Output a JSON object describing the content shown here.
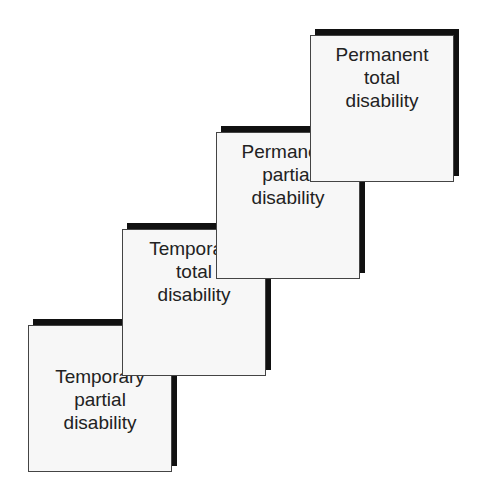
{
  "diagram": {
    "type": "staircase",
    "steps": [
      {
        "id": "temporary-partial",
        "lines": [
          "Temporary",
          "partial",
          "disability"
        ]
      },
      {
        "id": "temporary-total",
        "lines": [
          "Temporary",
          "total",
          "disability"
        ]
      },
      {
        "id": "permanent-partial",
        "lines": [
          "Permanent",
          "partial",
          "disability"
        ]
      },
      {
        "id": "permanent-total",
        "lines": [
          "Permanent",
          "total",
          "disability"
        ]
      }
    ],
    "colors": {
      "face": "#f7f7f7",
      "shadow": "#111111",
      "border": "#444444",
      "text": "#222222"
    }
  }
}
